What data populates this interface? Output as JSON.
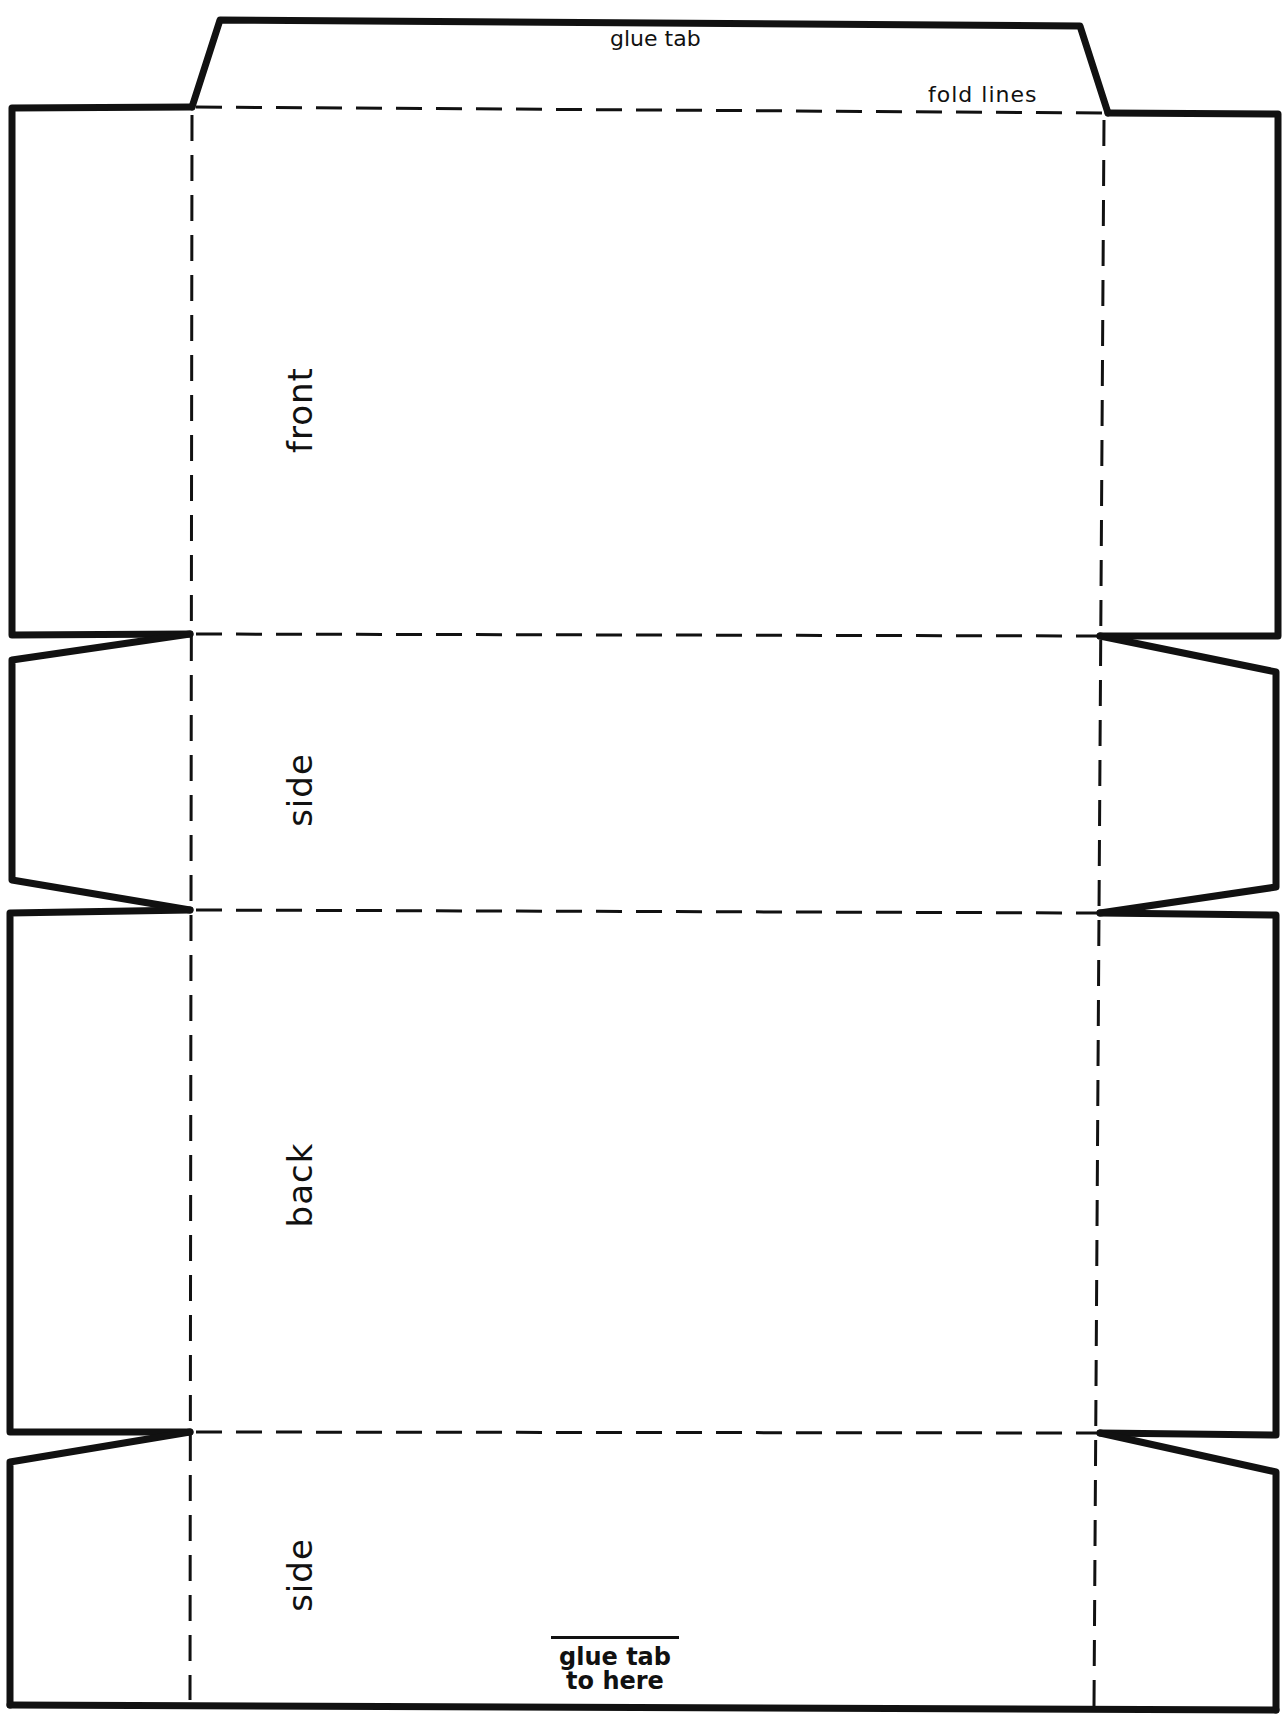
{
  "diagram": {
    "type": "box-net-template",
    "colors": {
      "line": "#111111",
      "background": "#ffffff"
    },
    "labels": {
      "glue_tab": "glue tab",
      "fold_lines": "fold lines",
      "front": "front",
      "side_1": "side",
      "back": "back",
      "side_2": "side",
      "glue_tab_to_here_line1": "glue tab",
      "glue_tab_to_here_line2": "to here"
    },
    "panels": [
      {
        "name": "glue tab",
        "position": "top"
      },
      {
        "name": "front",
        "position": 1
      },
      {
        "name": "side",
        "position": 2
      },
      {
        "name": "back",
        "position": 3
      },
      {
        "name": "side",
        "position": 4
      }
    ],
    "legend": {
      "solid_line": "cut line",
      "dashed_line": "fold lines"
    }
  }
}
